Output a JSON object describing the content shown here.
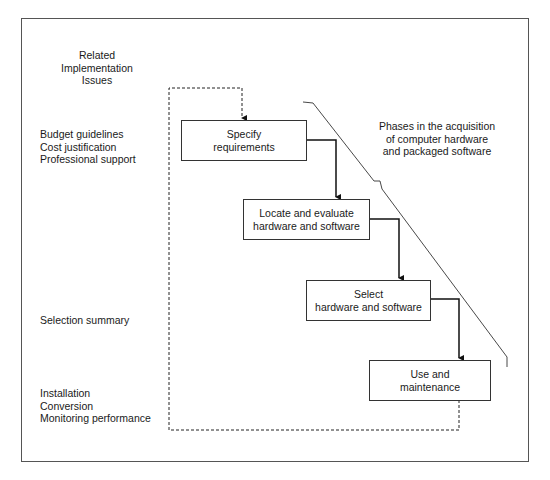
{
  "diagram": {
    "left_column": {
      "heading": [
        "Related",
        "Implementation",
        "Issues"
      ],
      "groups": [
        {
          "items": [
            "Budget guidelines",
            "Cost justification",
            "Professional support"
          ]
        },
        {
          "items": [
            "Selection summary"
          ]
        },
        {
          "items": [
            "Installation",
            "Conversion",
            "Monitoring performance"
          ]
        }
      ]
    },
    "phases_label": [
      "Phases in the acquisition",
      "of computer hardware",
      "and packaged software"
    ],
    "phases": [
      {
        "lines": [
          "Specify",
          "requirements"
        ]
      },
      {
        "lines": [
          "Locate and evaluate",
          "hardware and software"
        ]
      },
      {
        "lines": [
          "Select",
          "hardware and software"
        ]
      },
      {
        "lines": [
          "Use and",
          "maintenance"
        ]
      }
    ],
    "colors": {
      "line": "#222222",
      "border": "#555555",
      "background": "#ffffff"
    }
  }
}
